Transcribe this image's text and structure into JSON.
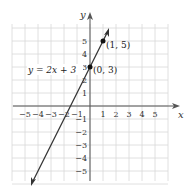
{
  "chart_data": {
    "type": "line",
    "title": "",
    "xlabel": "x",
    "ylabel": "y",
    "xlim": [
      -6,
      6
    ],
    "ylim": [
      -6,
      6
    ],
    "grid": true,
    "x_ticks": [
      "−5",
      "−4",
      "−3",
      "−2",
      "−1",
      "1",
      "2",
      "3",
      "4",
      "5"
    ],
    "y_ticks": [
      "5",
      "4",
      "3",
      "2",
      "1",
      "−1",
      "−2",
      "−3",
      "−4",
      "−5"
    ],
    "series": [
      {
        "name": "y = 2x + 3",
        "equation": "y = 2x + 3",
        "slope": 2,
        "intercept": 3,
        "x": [
          -4.5,
          1.5
        ],
        "y": [
          -6,
          6
        ]
      }
    ],
    "points": [
      {
        "x": 0,
        "y": 3,
        "label": "(0, 3)"
      },
      {
        "x": 1,
        "y": 5,
        "label": "(1, 5)"
      }
    ],
    "annotations": [
      "y = 2x + 3",
      "(0, 3)",
      "(1, 5)"
    ]
  },
  "labels": {
    "equation": "y = 2x + 3",
    "p1": "(0, 3)",
    "p2": "(1, 5)",
    "xaxis": "x",
    "yaxis": "y",
    "xt": [
      "−5",
      "−4",
      "−3",
      "−2",
      "−1",
      "1",
      "2",
      "3",
      "4",
      "5"
    ],
    "yt": [
      "5",
      "4",
      "3",
      "2",
      "1",
      "−1",
      "−2",
      "−3",
      "−4",
      "−5"
    ]
  },
  "colors": {
    "grid": "#d8d8d8",
    "axis": "#555555",
    "line": "#333333"
  }
}
